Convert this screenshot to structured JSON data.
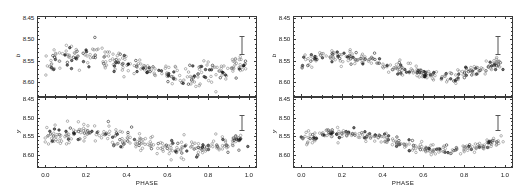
{
  "figure": {
    "background_color": "#ffffff",
    "axis_color": "#3a3a3a",
    "point_color": "#6e6e6e",
    "point_color_dark": "#2a2a2a",
    "errorbar_color": "#555555"
  },
  "axes": {
    "x": {
      "label": "PHASE",
      "ticks": [
        "0.0",
        "0.2",
        "0.4",
        "0.6",
        "0.8",
        "1.0"
      ],
      "tick_values": [
        0.0,
        0.2,
        0.4,
        0.6,
        0.8,
        1.0
      ],
      "min": -0.04,
      "max": 1.04
    },
    "y": {
      "ticks": [
        "8.45",
        "8.50",
        "8.55",
        "8.60"
      ],
      "tick_values": [
        8.45,
        8.5,
        8.55,
        8.6
      ],
      "min": 8.445,
      "max": 8.635,
      "inverted": true
    }
  },
  "panels": [
    {
      "id": "left-top",
      "ylabel": "b",
      "errorbar": {
        "phase": 0.965,
        "center": 8.515,
        "half_length": 0.022
      }
    },
    {
      "id": "left-bottom",
      "ylabel": "y",
      "errorbar": {
        "phase": 0.965,
        "center": 8.515,
        "half_length": 0.022
      }
    },
    {
      "id": "right-top",
      "ylabel": "b",
      "errorbar": {
        "phase": 0.965,
        "center": 8.515,
        "half_length": 0.022
      }
    },
    {
      "id": "right-bottom",
      "ylabel": "y",
      "errorbar": {
        "phase": 0.965,
        "center": 8.515,
        "half_length": 0.022
      }
    }
  ],
  "chart_data": [
    {
      "type": "scatter",
      "id": "left-top",
      "title": "",
      "xlabel": "PHASE",
      "ylabel": "b",
      "xlim": [
        -0.04,
        1.04
      ],
      "ylim": [
        8.635,
        8.445
      ],
      "grid": false,
      "legend": "none",
      "marker": "open-circle",
      "series": [
        {
          "name": "b magnitude (trial period)",
          "model": {
            "mean": 8.5625,
            "amplitude": 0.0215,
            "phase_of_max": 0.185,
            "scatter": 0.0135
          },
          "n_points": 255
        }
      ]
    },
    {
      "type": "scatter",
      "id": "left-bottom",
      "title": "",
      "xlabel": "PHASE",
      "ylabel": "y",
      "xlim": [
        -0.04,
        1.04
      ],
      "ylim": [
        8.635,
        8.445
      ],
      "grid": false,
      "legend": "none",
      "marker": "open-circle",
      "series": [
        {
          "name": "y magnitude (trial period)",
          "model": {
            "mean": 8.564,
            "amplitude": 0.0205,
            "phase_of_max": 0.2,
            "scatter": 0.014
          },
          "n_points": 255
        }
      ]
    },
    {
      "type": "scatter",
      "id": "right-top",
      "title": "",
      "xlabel": "PHASE",
      "ylabel": "b",
      "xlim": [
        -0.04,
        1.04
      ],
      "ylim": [
        8.635,
        8.445
      ],
      "grid": false,
      "legend": "none",
      "marker": "open-circle",
      "series": [
        {
          "name": "b magnitude (adopted period)",
          "model": {
            "mean": 8.5625,
            "amplitude": 0.0235,
            "phase_of_max": 0.185,
            "scatter": 0.0072
          },
          "n_points": 255
        }
      ]
    },
    {
      "type": "scatter",
      "id": "right-bottom",
      "title": "",
      "xlabel": "PHASE",
      "ylabel": "y",
      "xlim": [
        -0.04,
        1.04
      ],
      "ylim": [
        8.635,
        8.445
      ],
      "grid": false,
      "legend": "none",
      "marker": "open-circle",
      "series": [
        {
          "name": "y magnitude (adopted period)",
          "model": {
            "mean": 8.565,
            "amplitude": 0.0225,
            "phase_of_max": 0.21,
            "scatter": 0.007
          },
          "n_points": 255
        }
      ]
    }
  ]
}
